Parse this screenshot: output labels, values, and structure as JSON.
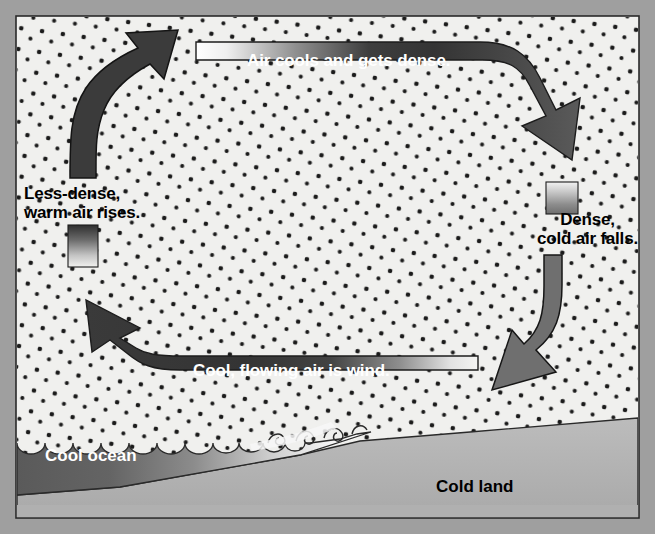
{
  "figure": {
    "domain": "diagram",
    "canvas": {
      "width": 655,
      "height": 534
    }
  },
  "colors": {
    "frame": "#9f9f9f",
    "sky": "#f0f0ee",
    "sky_dot": "#1b1b1b",
    "arrow_dark": "#3b3b3b",
    "arrow_mid": "#6f6f6f",
    "outline": "#161616",
    "ocean_dark": "#5d5d5d",
    "ocean_light": "#f2f2f2",
    "land": "#b4b4b4",
    "land_shadow": "#a4a4a4",
    "text_dark": "#000000",
    "text_light": "#ffffff"
  },
  "labels": {
    "top_band": "Air cools and gets dense.",
    "right_column": "Dense,\ncold air falls.",
    "bottom_band": "Cool, flowing air is wind.",
    "left_column": "Less-dense,\nwarm air rises.",
    "ocean": "Cool ocean",
    "land": "Cold land"
  },
  "flow": {
    "steps": [
      {
        "id": "rise",
        "label": "Less-dense, warm air rises.",
        "direction": "up",
        "side": "left",
        "tone": "dark"
      },
      {
        "id": "cool",
        "label": "Air cools and gets dense.",
        "direction": "left-to-right",
        "side": "top",
        "tone": "dark"
      },
      {
        "id": "fall",
        "label": "Dense, cold air falls.",
        "direction": "down",
        "side": "right",
        "tone": "mid"
      },
      {
        "id": "wind",
        "label": "Cool, flowing air is wind.",
        "direction": "right-to-left",
        "side": "bottom",
        "tone": "dark"
      }
    ]
  },
  "surface": {
    "ocean_label": "Cool ocean",
    "land_label": "Cold land",
    "wave_count": 11
  }
}
